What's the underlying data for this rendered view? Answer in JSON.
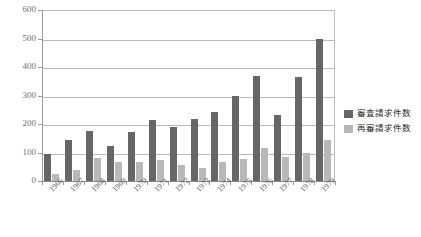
{
  "chart_data": {
    "type": "bar",
    "title": "",
    "xlabel": "",
    "ylabel": "",
    "ylim": [
      0,
      600
    ],
    "ytick_step": 100,
    "yticks": [
      "600",
      "500",
      "400",
      "300",
      "200",
      "100",
      "0"
    ],
    "grid": true,
    "legend_position": "right",
    "categories": [
      "1966",
      "1967",
      "1968",
      "1969",
      "1970",
      "1971",
      "1972",
      "1973",
      "1974",
      "1975",
      "1976",
      "1977",
      "1978",
      "1979"
    ],
    "series": [
      {
        "name": "審査請求件数",
        "color": "#666666",
        "values": [
          95,
          143,
          177,
          122,
          173,
          213,
          188,
          218,
          242,
          300,
          370,
          230,
          365,
          500
        ]
      },
      {
        "name": "再審請求件数",
        "color": "#b8b8b8",
        "values": [
          25,
          37,
          80,
          67,
          68,
          75,
          55,
          45,
          68,
          78,
          115,
          85,
          100,
          145
        ]
      }
    ]
  },
  "legend": {
    "items": [
      {
        "label": "審査請求件数",
        "swatch": "dark"
      },
      {
        "label": "再審請求件数",
        "swatch": "light"
      }
    ]
  }
}
